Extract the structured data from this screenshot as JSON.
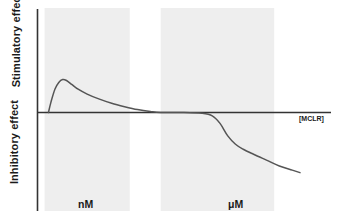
{
  "chart_data": {
    "type": "line",
    "title": "",
    "subtitle": "",
    "xlabel": "[MCLR]",
    "ylabel_upper": "Stimulatory effect",
    "ylabel_lower": "Inhibitory effect",
    "x_tick_labels": [
      "nM",
      "μM"
    ],
    "y_tick_labels": [],
    "grid": false,
    "legend": null,
    "axis_zero_line": true,
    "xlim": [
      0,
      100
    ],
    "ylim": [
      -100,
      100
    ],
    "series": [
      {
        "name": "MCLR effect",
        "color": "#555555",
        "points": [
          {
            "x": 2.5,
            "y": 0
          },
          {
            "x": 3.5,
            "y": 22
          },
          {
            "x": 5.0,
            "y": 48
          },
          {
            "x": 6.5,
            "y": 62
          },
          {
            "x": 8.0,
            "y": 68
          },
          {
            "x": 9.5,
            "y": 66
          },
          {
            "x": 11.5,
            "y": 58
          },
          {
            "x": 14.0,
            "y": 48
          },
          {
            "x": 17.5,
            "y": 38
          },
          {
            "x": 22.0,
            "y": 28
          },
          {
            "x": 27.0,
            "y": 19
          },
          {
            "x": 32.0,
            "y": 12
          },
          {
            "x": 37.0,
            "y": 6
          },
          {
            "x": 42.0,
            "y": 2
          },
          {
            "x": 46.0,
            "y": 0
          },
          {
            "x": 55.0,
            "y": 0
          },
          {
            "x": 62.0,
            "y": -1
          },
          {
            "x": 66.0,
            "y": -4
          },
          {
            "x": 69.0,
            "y": -13
          },
          {
            "x": 72.0,
            "y": -28
          },
          {
            "x": 75.0,
            "y": -38
          },
          {
            "x": 78.0,
            "y": -44
          },
          {
            "x": 82.0,
            "y": -50
          },
          {
            "x": 87.0,
            "y": -57
          },
          {
            "x": 92.0,
            "y": -64
          },
          {
            "x": 97.0,
            "y": -69
          },
          {
            "x": 100.0,
            "y": -72
          }
        ]
      }
    ],
    "bands": [
      {
        "name": "nanomolar-band",
        "x_start": 1,
        "x_end": 34,
        "color": "#eeeeee"
      },
      {
        "name": "micromolar-band",
        "x_start": 46,
        "x_end": 90,
        "color": "#eeeeee"
      }
    ]
  }
}
